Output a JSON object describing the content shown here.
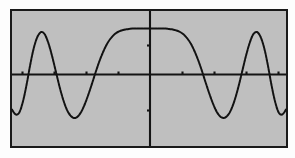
{
  "figure": {
    "title": "",
    "background_color": "#bfbfbf",
    "page_color": "#fdfdfd",
    "border_color": "#1a1a1a",
    "curve_color": "#121212",
    "axis_color": "#141414",
    "frame": {
      "x": 10,
      "y": 9,
      "width": 278,
      "height": 139
    }
  },
  "chart_data": {
    "type": "line",
    "title": "",
    "subtitle": "",
    "xlabel": "",
    "ylabel": "",
    "xlim": [
      -7.5,
      7.5
    ],
    "ylim": [
      -1.35,
      1.35
    ],
    "grid": false,
    "legend": null,
    "legend_position": "none",
    "annotations": [],
    "axes": {
      "x_axis_y_value": 0,
      "y_axis_x_value": 0,
      "x_tick_values": [
        -6,
        -4.5,
        -3,
        -1.5,
        1.5,
        3,
        4.5,
        6
      ],
      "y_tick_values": [
        -1,
        1
      ],
      "x_tick_labels": [],
      "y_tick_labels": [],
      "tick_labels_shown": false,
      "spines": "crossed-at-origin"
    },
    "series": [
      {
        "name": "waveform",
        "line_style": "dashed",
        "line_width": 2,
        "color": "#121212",
        "description": "Flat-topped central lobe with decaying side oscillations",
        "x": [
          -7.5,
          -7.3,
          -7.1,
          -6.9,
          -6.7,
          -6.5,
          -6.3,
          -6.1,
          -5.9,
          -5.7,
          -5.5,
          -5.3,
          -5.1,
          -4.9,
          -4.7,
          -4.5,
          -4.3,
          -4.1,
          -3.9,
          -3.7,
          -3.5,
          -3.3,
          -3.1,
          -2.9,
          -2.7,
          -2.5,
          -2.3,
          -2.1,
          -1.9,
          -1.7,
          -1.5,
          -1.3,
          -1.1,
          -0.9,
          -0.7,
          -0.5,
          -0.3,
          -0.1,
          0.1,
          0.3,
          0.5,
          0.7,
          0.9,
          1.1,
          1.3,
          1.5,
          1.7,
          1.9,
          2.1,
          2.3,
          2.5,
          2.7,
          2.9,
          3.1,
          3.3,
          3.5,
          3.7,
          3.9,
          4.1,
          4.3,
          4.5,
          4.7,
          4.9,
          5.1,
          5.3,
          5.5,
          5.7,
          5.9,
          6.1,
          6.3,
          6.5,
          6.7,
          6.9,
          7.1,
          7.3,
          7.5
        ],
        "y": [
          -0.62,
          -0.72,
          -0.68,
          -0.46,
          -0.12,
          0.28,
          0.62,
          0.84,
          0.93,
          0.88,
          0.7,
          0.44,
          0.14,
          -0.16,
          -0.42,
          -0.62,
          -0.74,
          -0.79,
          -0.76,
          -0.66,
          -0.5,
          -0.3,
          -0.08,
          0.15,
          0.36,
          0.54,
          0.69,
          0.8,
          0.88,
          0.93,
          0.96,
          0.98,
          0.99,
          1.0,
          1.0,
          1.0,
          1.0,
          1.0,
          1.0,
          1.0,
          1.0,
          1.0,
          1.0,
          0.99,
          0.98,
          0.96,
          0.93,
          0.88,
          0.8,
          0.69,
          0.54,
          0.36,
          0.15,
          -0.08,
          -0.3,
          -0.5,
          -0.66,
          -0.76,
          -0.79,
          -0.74,
          -0.62,
          -0.42,
          -0.16,
          0.14,
          0.44,
          0.7,
          0.88,
          0.93,
          0.84,
          0.62,
          0.28,
          -0.12,
          -0.46,
          -0.68,
          -0.72,
          -0.62
        ],
        "features": {
          "left_peak": {
            "x": -5.9,
            "y": 0.93
          },
          "left_trough": {
            "x": -4.1,
            "y": -0.79
          },
          "flat_top_start": {
            "x": -0.95,
            "y": 1.0
          },
          "flat_top_end": {
            "x": 0.95,
            "y": 1.0
          },
          "right_trough": {
            "x": 4.1,
            "y": -0.79
          },
          "right_peak": {
            "x": 5.9,
            "y": 0.93
          }
        }
      }
    ]
  }
}
